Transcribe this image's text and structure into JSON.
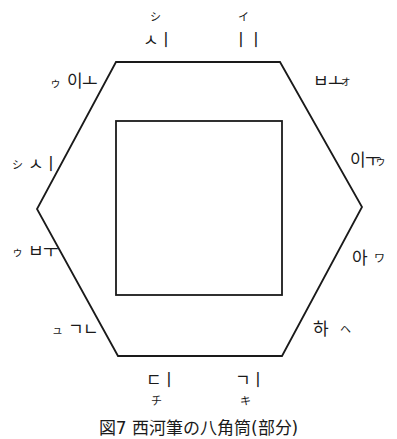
{
  "figure": {
    "caption": "図7 西河筆の八角筒(部分)",
    "outer_shape": "hexagon",
    "inner_shape": "square",
    "stroke_color": "#1a1a1a"
  },
  "labels": {
    "top_left": {
      "jamo": "ㅅㅣ",
      "kana": "シ"
    },
    "top_right": {
      "jamo": "ㅣㅣ",
      "kana": "イ"
    },
    "upper_left": {
      "jamo": "이ㅗ",
      "kana": "ゥ"
    },
    "upper_right": {
      "jamo": "ㅂㅗ",
      "kana": "ォ"
    },
    "mid_left": {
      "jamo": "ㅅㅣ",
      "kana": "シ"
    },
    "mid_right": {
      "jamo": "이ㅜ",
      "kana": "ゥ"
    },
    "lower_left": {
      "jamo": "ㅂㅜ",
      "kana": "ゥ"
    },
    "lower_right": {
      "jamo": "아",
      "kana": "ワ"
    },
    "bottom_left_side": {
      "jamo": "ㄱㄴ",
      "kana": "ュ"
    },
    "bottom_right_side": {
      "jamo": "하",
      "kana": "ヘ"
    },
    "bottom_left": {
      "jamo": "ㄷㅣ",
      "kana": "チ"
    },
    "bottom_right": {
      "jamo": "ㄱㅣ",
      "kana": "キ"
    }
  }
}
